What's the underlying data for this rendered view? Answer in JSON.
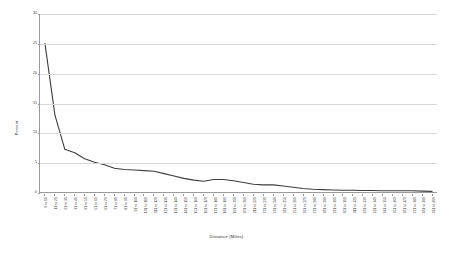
{
  "chart_data": {
    "type": "line",
    "title": "",
    "xlabel": "Distance (Miles)",
    "ylabel": "Percent",
    "ylim": [
      0,
      30
    ],
    "yticks": [
      0,
      5,
      10,
      15,
      20,
      25,
      30
    ],
    "grid": true,
    "legend": false,
    "line_color": "#3d3d3d",
    "grid_color": "#d8d8d8",
    "axis_color": "#9a9a9a",
    "categories": [
      "0 to 10",
      "11 to 20",
      "21 to 30",
      "31 to 40",
      "41 to 50",
      "51 to 60",
      "61 to 70",
      "71 to 80",
      "81 to 90",
      "91 to 100",
      "101 to 110",
      "111 to 120",
      "121 to 130",
      "131 to 140",
      "141 to 150",
      "151 to 160",
      "161 to 170",
      "171 to 180",
      "181 to 190",
      "191 to 200",
      "201 to 210",
      "211 to 220",
      "221 to 230",
      "231 to 240",
      "241 to 250",
      "251 to 260",
      "261 to 270",
      "271 to 280",
      "281 to 290",
      "291 to 300",
      "301 to 310",
      "311 to 320",
      "321 to 330",
      "331 to 340",
      "341 to 350",
      "351 to 360",
      "361 to 370",
      "371 to 380",
      "381 to 390",
      "391 to 400"
    ],
    "values": [
      25.0,
      13.0,
      7.2,
      6.6,
      5.6,
      5.0,
      4.6,
      4.0,
      3.8,
      3.7,
      3.6,
      3.5,
      3.1,
      2.7,
      2.3,
      2.0,
      1.8,
      2.1,
      2.1,
      1.9,
      1.6,
      1.3,
      1.2,
      1.2,
      1.0,
      0.8,
      0.6,
      0.45,
      0.4,
      0.35,
      0.3,
      0.3,
      0.25,
      0.25,
      0.2,
      0.2,
      0.2,
      0.2,
      0.15,
      0.1
    ]
  }
}
